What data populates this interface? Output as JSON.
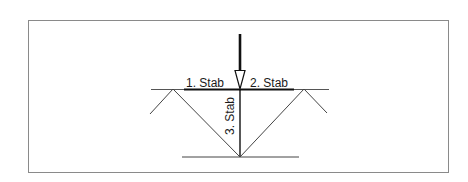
{
  "figure": {
    "type": "structural-diagram",
    "colors": {
      "line": "#3a3a3a",
      "heavy_line": "#111111",
      "frame": "#8a8a8a",
      "background": "#ffffff"
    }
  },
  "labels": {
    "bar1": "1. Stab",
    "bar2": "2. Stab",
    "bar3": "3. Stab"
  },
  "elements": {
    "load_arrow": "force-arrow",
    "top_beam": "horizontal-line",
    "bottom_beam": "horizontal-line",
    "diagonals": "v-shaped-diagonal-members"
  }
}
